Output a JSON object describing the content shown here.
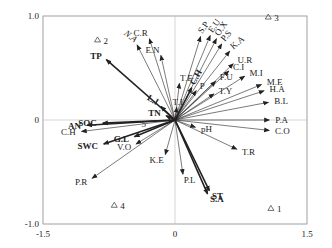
{
  "chart_data": {
    "type": "scatter",
    "subtype": "RDA biplot (arrows = variables, triangles = samples)",
    "title": "",
    "xlabel": "",
    "ylabel": "",
    "xlim": [
      -1.5,
      1.5
    ],
    "ylim": [
      -1.0,
      1.0
    ],
    "x_ticks": [
      "-1.5",
      "0",
      "1.5"
    ],
    "y_ticks": [
      "1.0",
      "0",
      "-1.0"
    ],
    "zero_lines": true,
    "grid": false,
    "legend": null,
    "samples": [
      {
        "label": "1",
        "x": 1.09,
        "y": -0.85
      },
      {
        "label": "2",
        "x": -0.88,
        "y": 0.77
      },
      {
        "label": "3",
        "x": 1.06,
        "y": 0.99
      },
      {
        "label": "4",
        "x": -0.69,
        "y": -0.82
      },
      {
        "label": "5",
        "x": -0.45,
        "y": -0.03
      }
    ],
    "arrows": [
      {
        "label": "C.R",
        "x": -0.29,
        "y": 0.78,
        "weight": "thin"
      },
      {
        "label": "N.A",
        "x": -0.43,
        "y": 0.72,
        "weight": "thin",
        "italic": true,
        "rot": 38
      },
      {
        "label": "E.N",
        "x": -0.16,
        "y": 0.62,
        "weight": "thin"
      },
      {
        "label": "TP",
        "x": -0.78,
        "y": 0.58,
        "weight": "bold"
      },
      {
        "label": "S.P",
        "x": 0.29,
        "y": 0.8,
        "weight": "thin",
        "rot": -55
      },
      {
        "label": "E.U",
        "x": 0.4,
        "y": 0.81,
        "weight": "thin",
        "rot": -55
      },
      {
        "label": "O.X",
        "x": 0.47,
        "y": 0.78,
        "weight": "thin",
        "rot": -55
      },
      {
        "label": "P.S",
        "x": 0.53,
        "y": 0.73,
        "weight": "thin",
        "rot": -50
      },
      {
        "label": "K.A",
        "x": 0.62,
        "y": 0.66,
        "weight": "thin",
        "rot": -40
      },
      {
        "label": "U.R",
        "x": 0.66,
        "y": 0.54,
        "weight": "thin"
      },
      {
        "label": "C.I",
        "x": 0.61,
        "y": 0.47,
        "weight": "thin"
      },
      {
        "label": "M.I",
        "x": 0.79,
        "y": 0.42,
        "weight": "thin"
      },
      {
        "label": "F.U",
        "x": 0.46,
        "y": 0.37,
        "weight": "thin"
      },
      {
        "label": "M.E",
        "x": 0.98,
        "y": 0.34,
        "weight": "thin"
      },
      {
        "label": "H.A",
        "x": 1.01,
        "y": 0.28,
        "weight": "thin"
      },
      {
        "label": "T.Y",
        "x": 0.44,
        "y": 0.25,
        "weight": "thin"
      },
      {
        "label": "B.L",
        "x": 1.06,
        "y": 0.17,
        "weight": "thin"
      },
      {
        "label": "P.A",
        "x": 1.07,
        "y": 0.0,
        "weight": "thin"
      },
      {
        "label": "C.O",
        "x": 1.07,
        "y": -0.1,
        "weight": "thin"
      },
      {
        "label": "T.R",
        "x": 0.7,
        "y": -0.28,
        "weight": "thin"
      },
      {
        "label": "pH",
        "x": 0.23,
        "y": -0.07,
        "weight": "thin"
      },
      {
        "label": "T.E",
        "x": 0.05,
        "y": 0.35,
        "weight": "thin"
      },
      {
        "label": "C.H",
        "x": 0.19,
        "y": 0.31,
        "weight": "bold",
        "note": "upper-right C.H",
        "rot": -60
      },
      {
        "label": "P",
        "x": 0.24,
        "y": 0.28,
        "weight": "thin"
      },
      {
        "label": "T.I",
        "x": 0.02,
        "y": 0.12,
        "weight": "thin"
      },
      {
        "label": "L.I",
        "x": -0.16,
        "y": 0.13,
        "weight": "bold",
        "rot": 30
      },
      {
        "label": "TN",
        "x": -0.1,
        "y": 0.04,
        "weight": "bold"
      },
      {
        "label": "SOC",
        "x": -0.82,
        "y": -0.03,
        "weight": "bold"
      },
      {
        "label": "AN",
        "x": -1.0,
        "y": -0.05,
        "weight": "bold"
      },
      {
        "label": "C.H",
        "x": -1.06,
        "y": -0.11,
        "weight": "thin",
        "note": "lower-left C.H"
      },
      {
        "label": "G.L",
        "x": -0.46,
        "y": -0.16,
        "weight": "bold"
      },
      {
        "label": "SWC",
        "x": -0.81,
        "y": -0.23,
        "weight": "bold"
      },
      {
        "label": "V.O",
        "x": -0.44,
        "y": -0.23,
        "weight": "thin"
      },
      {
        "label": "K.E",
        "x": -0.11,
        "y": -0.33,
        "weight": "thin"
      },
      {
        "label": "P.R",
        "x": -0.94,
        "y": -0.56,
        "weight": "thin"
      },
      {
        "label": "P.L",
        "x": 0.09,
        "y": -0.52,
        "weight": "thin"
      },
      {
        "label": "ST",
        "x": 0.39,
        "y": -0.68,
        "weight": "bold"
      },
      {
        "label": "S.A",
        "x": 0.37,
        "y": -0.71,
        "weight": "bold"
      }
    ]
  }
}
